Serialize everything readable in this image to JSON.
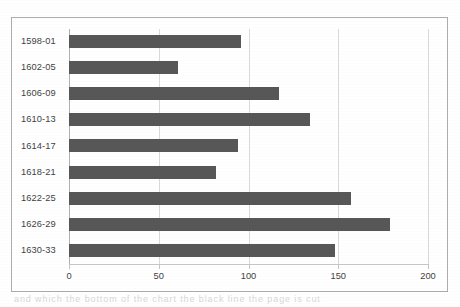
{
  "chart_data": {
    "type": "bar",
    "orientation": "horizontal",
    "title": "",
    "xlabel": "",
    "ylabel": "",
    "categories": [
      "1598-01",
      "1602-05",
      "1606-09",
      "1610-13",
      "1614-17",
      "1618-21",
      "1622-25",
      "1626-29",
      "1630-33"
    ],
    "values": [
      96,
      61,
      117,
      134,
      94,
      82,
      157,
      179,
      148
    ],
    "xlim": [
      0,
      200
    ],
    "xticks": [
      0,
      50,
      100,
      150,
      200
    ],
    "xtick_labels": [
      "0",
      "50",
      "100",
      "150",
      "200"
    ],
    "grid": "vertical",
    "legend": "none",
    "series": [
      {
        "name": "",
        "values": [
          96,
          61,
          117,
          134,
          94,
          82,
          157,
          179,
          148
        ]
      }
    ]
  },
  "style": {
    "bar_color": "#575757",
    "gridline_color": "#d9d9d9",
    "frame_color": "#adadad",
    "label_color": "#3f3f3f",
    "background": "#ffffff"
  },
  "scan": {
    "artifact_text": "and which the bottom of the chart the black line the page is cut"
  }
}
